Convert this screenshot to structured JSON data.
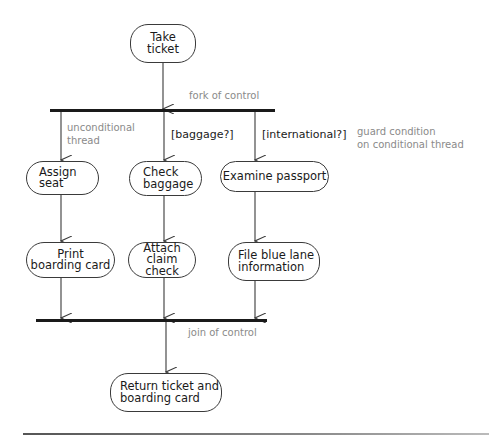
{
  "diagram": {
    "type": "UML activity diagram",
    "nodes": {
      "take_ticket": "Take\nticket",
      "assign_seat": "Assign\nseat",
      "check_baggage": "Check\nbaggage",
      "examine_passport": "Examine passport",
      "print_boarding_card": "Print\nboarding card",
      "attach_claim_check": "Attach\nclaim check",
      "file_blue_lane": "File blue lane\ninformation",
      "return_ticket": "Return ticket and\nboarding card"
    },
    "guards": {
      "baggage": "[baggage?]",
      "international": "[international?]"
    },
    "annotations": {
      "fork": "fork of control",
      "unconditional": "unconditional\nthread",
      "guard_condition": "guard condition\non conditional thread",
      "join": "join of control"
    },
    "edges": [
      {
        "from": "take_ticket",
        "to": "fork"
      },
      {
        "from": "fork",
        "to": "assign_seat"
      },
      {
        "from": "fork",
        "to": "check_baggage",
        "guard": "[baggage?]"
      },
      {
        "from": "fork",
        "to": "examine_passport",
        "guard": "[international?]"
      },
      {
        "from": "assign_seat",
        "to": "print_boarding_card"
      },
      {
        "from": "check_baggage",
        "to": "attach_claim_check"
      },
      {
        "from": "examine_passport",
        "to": "file_blue_lane"
      },
      {
        "from": "print_boarding_card",
        "to": "join"
      },
      {
        "from": "attach_claim_check",
        "to": "join"
      },
      {
        "from": "file_blue_lane",
        "to": "join"
      },
      {
        "from": "join",
        "to": "return_ticket"
      }
    ],
    "colors": {
      "line": "#3a3a3a",
      "bar": "#1a1a1a",
      "annotation_text": "#8a8a8a"
    }
  }
}
